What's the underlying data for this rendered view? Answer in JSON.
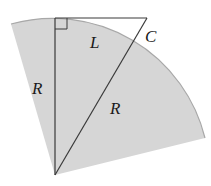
{
  "diagram": {
    "colors": {
      "sector_fill": "#d6d6d6",
      "sector_edge": "#a8a8a8",
      "line": "#3a3a3a",
      "label": "#1a1a1a",
      "background": "#ffffff"
    },
    "labels": {
      "left_radius": "R",
      "tangent": "L",
      "extension": "C",
      "hypotenuse_radius": "R"
    },
    "right_angle_marker": true
  }
}
